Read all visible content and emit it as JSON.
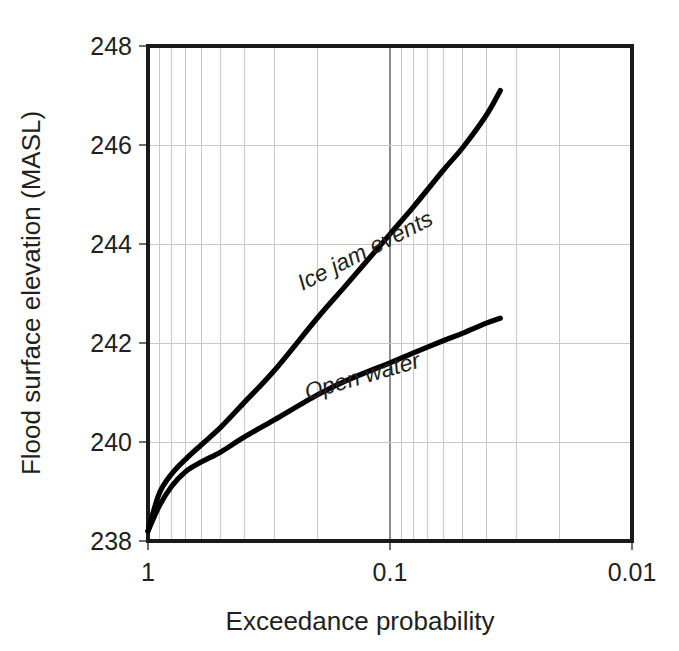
{
  "chart_data": {
    "type": "line",
    "title": "",
    "xlabel": "Exceedance probability",
    "ylabel": "Flood surface elevation (MASL)",
    "xscale": "log-reversed",
    "xlim": [
      1,
      0.01
    ],
    "ylim": [
      238,
      248
    ],
    "xticks": [
      "1",
      "0.1",
      "0.01"
    ],
    "xtick_values": [
      1,
      0.1,
      0.01
    ],
    "yticks": [
      "238",
      "240",
      "242",
      "244",
      "246",
      "248"
    ],
    "ytick_values": [
      238,
      240,
      242,
      244,
      246,
      248
    ],
    "grid": "log minor vertical gridlines and horizontal gridlines at every y tick",
    "legend_position": "inline labels along each curve",
    "series": [
      {
        "name": "Ice jam events",
        "label": "Ice jam events",
        "color": "#000000",
        "label_rotation_deg": -27,
        "x": [
          1.0,
          0.9,
          0.8,
          0.7,
          0.6,
          0.5,
          0.4,
          0.3,
          0.2,
          0.15,
          0.1,
          0.08,
          0.06,
          0.05,
          0.04,
          0.035
        ],
        "y": [
          238.2,
          238.95,
          239.35,
          239.65,
          239.95,
          240.3,
          240.8,
          241.45,
          242.5,
          243.2,
          244.2,
          244.75,
          245.5,
          245.95,
          246.6,
          247.1
        ]
      },
      {
        "name": "Open water",
        "label": "Open water",
        "color": "#000000",
        "label_rotation_deg": -16,
        "x": [
          1.0,
          0.9,
          0.8,
          0.7,
          0.6,
          0.5,
          0.4,
          0.3,
          0.2,
          0.15,
          0.1,
          0.08,
          0.06,
          0.05,
          0.04,
          0.035
        ],
        "y": [
          238.2,
          238.7,
          239.1,
          239.4,
          239.6,
          239.8,
          240.1,
          240.45,
          240.95,
          241.25,
          241.6,
          241.8,
          242.05,
          242.2,
          242.4,
          242.5
        ]
      }
    ],
    "annotations": [
      {
        "text": "Ice jam events",
        "x": 0.23,
        "y": 243.05
      },
      {
        "text": "Open water",
        "x": 0.22,
        "y": 240.85
      }
    ]
  },
  "axes": {
    "y_title": "Flood surface elevation (MASL)",
    "x_title": "Exceedance probability",
    "y_tick_labels": [
      "248",
      "246",
      "244",
      "242",
      "240",
      "238"
    ],
    "x_tick_labels": [
      "1",
      "0.1",
      "0.01"
    ]
  },
  "colors": {
    "background": "#ffffff",
    "curve": "#000000",
    "frame": "#1a1a1a",
    "grid_minor": "#c9c9c9",
    "grid_major": "#8d8d8d",
    "text": "#231f20"
  }
}
